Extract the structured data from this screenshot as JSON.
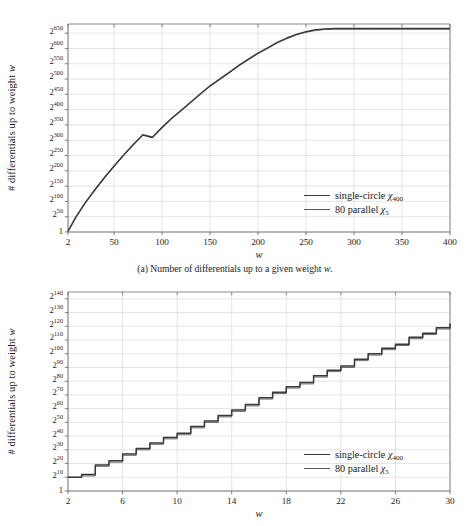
{
  "figure": {
    "background": "#ffffff",
    "axis_color": "#6e6e6e",
    "grid_color": "#d9d9d9",
    "series_colors": {
      "single_circle": "#3a3a3a",
      "parallel": "#5a5a5a"
    }
  },
  "panel_a": {
    "caption": "(a) Number of differentials up to a given weight w.",
    "caption_prefix": "(a) Number of differentials up to a given weight ",
    "caption_var": "w",
    "caption_suffix": ".",
    "ylabel_text": "# differentials up to weight ",
    "ylabel_var": "w",
    "xlabel": "w",
    "legend": [
      {
        "label": "single-circle ",
        "chi": "χ",
        "sub": "400",
        "color": "#3a3a3a",
        "width": 1.6
      },
      {
        "label": "80 parallel ",
        "chi": "χ",
        "sub": "5",
        "color": "#5a5a5a",
        "width": 0.9
      }
    ],
    "ytick_labels": [
      "1",
      "2²⁵⁰",
      "2¹⁰⁰",
      "2¹⁵⁰",
      "2²⁰⁰",
      "2²⁵⁰",
      "2³⁰⁰",
      "2³⁵⁰",
      "2⁴⁰⁰",
      "2⁴⁵⁰",
      "2⁵⁰⁰",
      "2⁵⁵⁰",
      "2⁶⁰⁰",
      "2⁶⁵⁰"
    ],
    "ytick_bases": [
      "1",
      "2",
      "2",
      "2",
      "2",
      "2",
      "2",
      "2",
      "2",
      "2",
      "2",
      "2",
      "2",
      "2"
    ],
    "ytick_exps": [
      "",
      "50",
      "100",
      "150",
      "200",
      "250",
      "300",
      "350",
      "400",
      "450",
      "500",
      "550",
      "600",
      "650"
    ],
    "ytick_values": [
      0,
      50,
      100,
      150,
      200,
      250,
      300,
      350,
      400,
      450,
      500,
      550,
      600,
      650
    ],
    "xtick_labels": [
      "2",
      "50",
      "100",
      "150",
      "200",
      "250",
      "300",
      "350",
      "400"
    ],
    "xtick_values": [
      2,
      50,
      100,
      150,
      200,
      250,
      300,
      350,
      400
    ]
  },
  "panel_b": {
    "caption": "",
    "ylabel_text": "# differentials up to weight ",
    "ylabel_var": "w",
    "xlabel": "w",
    "legend": [
      {
        "label": "single-circle ",
        "chi": "χ",
        "sub": "400",
        "color": "#3a3a3a",
        "width": 1.6
      },
      {
        "label": "80 parallel ",
        "chi": "χ",
        "sub": "5",
        "color": "#5a5a5a",
        "width": 0.9
      }
    ],
    "ytick_bases": [
      "1",
      "2",
      "2",
      "2",
      "2",
      "2",
      "2",
      "2",
      "2",
      "2",
      "2",
      "2",
      "2",
      "2",
      "2"
    ],
    "ytick_exps": [
      "",
      "10",
      "20",
      "30",
      "40",
      "50",
      "60",
      "70",
      "80",
      "90",
      "100",
      "110",
      "120",
      "130",
      "140"
    ],
    "ytick_values": [
      0,
      10,
      20,
      30,
      40,
      50,
      60,
      70,
      80,
      90,
      100,
      110,
      120,
      130,
      140
    ],
    "xtick_labels": [
      "2",
      "6",
      "10",
      "14",
      "18",
      "22",
      "26",
      "30"
    ],
    "xtick_values": [
      2,
      6,
      10,
      14,
      18,
      22,
      26,
      30
    ]
  },
  "chart_data": [
    {
      "id": "panel-a",
      "type": "line",
      "title": "(a) Number of differentials up to a given weight w.",
      "xlabel": "w",
      "ylabel": "# differentials up to weight w",
      "xlim": [
        2,
        400
      ],
      "ylim": [
        0,
        680
      ],
      "y_axis_scale": "log2 exponent",
      "grid": true,
      "legend_position": "inside-right-lower",
      "xticks": [
        2,
        50,
        100,
        150,
        200,
        250,
        300,
        350,
        400
      ],
      "yticks": [
        0,
        50,
        100,
        150,
        200,
        250,
        300,
        350,
        400,
        450,
        500,
        550,
        600,
        650
      ],
      "ytick_labels": [
        "1",
        "2^50",
        "2^100",
        "2^150",
        "2^200",
        "2^250",
        "2^300",
        "2^350",
        "2^400",
        "2^450",
        "2^500",
        "2^550",
        "2^600",
        "2^650"
      ],
      "series": [
        {
          "name": "single-circle χ400",
          "color": "#3a3a3a",
          "x": [
            2,
            10,
            20,
            30,
            40,
            50,
            60,
            70,
            80,
            90,
            100,
            110,
            120,
            130,
            140,
            150,
            160,
            170,
            180,
            190,
            200,
            210,
            220,
            230,
            240,
            250,
            260,
            270,
            280,
            285,
            290,
            300,
            320,
            340,
            360,
            380,
            400
          ],
          "y": [
            2,
            48,
            96,
            138,
            178,
            216,
            252,
            286,
            318,
            310,
            342,
            372,
            398,
            425,
            452,
            478,
            500,
            522,
            545,
            565,
            585,
            602,
            620,
            634,
            646,
            655,
            661,
            664,
            665,
            665,
            665,
            665,
            665,
            665,
            665,
            665,
            665
          ],
          "y_units": "log2(count)"
        },
        {
          "name": "80 parallel χ5",
          "color": "#5a5a5a",
          "x": [
            2,
            10,
            20,
            30,
            40,
            50,
            60,
            70,
            80,
            90,
            100,
            110,
            120,
            130,
            140,
            150,
            160,
            170,
            180,
            190,
            200,
            210,
            220,
            230,
            240,
            250,
            260,
            270,
            280,
            285,
            290,
            300,
            320,
            340,
            360,
            380,
            400
          ],
          "y": [
            2,
            46,
            94,
            136,
            176,
            214,
            250,
            284,
            316,
            308,
            340,
            370,
            396,
            423,
            450,
            476,
            498,
            520,
            543,
            563,
            583,
            600,
            618,
            632,
            644,
            653,
            659,
            662,
            663,
            663,
            663,
            663,
            663,
            663,
            663,
            663,
            663
          ],
          "y_units": "log2(count)"
        }
      ],
      "note": "Both series nearly coincide; curve rises concavely from ~2^2 at w=2 and saturates near 2^665 at w≈285."
    },
    {
      "id": "panel-b",
      "type": "line",
      "line_style": "step",
      "title": "",
      "xlabel": "w",
      "ylabel": "# differentials up to weight w",
      "xlim": [
        2,
        30
      ],
      "ylim": [
        0,
        145
      ],
      "y_axis_scale": "log2 exponent",
      "grid": true,
      "legend_position": "inside-right-lower",
      "xticks": [
        2,
        6,
        10,
        14,
        18,
        22,
        26,
        30
      ],
      "yticks": [
        0,
        10,
        20,
        30,
        40,
        50,
        60,
        70,
        80,
        90,
        100,
        110,
        120,
        130,
        140
      ],
      "ytick_labels": [
        "1",
        "2^10",
        "2^20",
        "2^30",
        "2^40",
        "2^50",
        "2^60",
        "2^70",
        "2^80",
        "2^90",
        "2^100",
        "2^110",
        "2^120",
        "2^130",
        "2^140"
      ],
      "series": [
        {
          "name": "single-circle χ400",
          "color": "#3a3a3a",
          "x": [
            2,
            3,
            4,
            5,
            6,
            7,
            8,
            9,
            10,
            11,
            12,
            13,
            14,
            15,
            16,
            17,
            18,
            19,
            20,
            21,
            22,
            23,
            24,
            25,
            26,
            27,
            28,
            29,
            30
          ],
          "y": [
            10,
            12,
            19,
            22,
            27,
            31,
            35,
            39,
            42,
            47,
            51,
            55,
            59,
            63,
            68,
            72,
            76,
            79,
            84,
            88,
            91,
            96,
            100,
            104,
            107,
            112,
            115,
            119,
            122
          ],
          "y_units": "log2(count)"
        },
        {
          "name": "80 parallel χ5",
          "color": "#5a5a5a",
          "x": [
            2,
            3,
            4,
            5,
            6,
            7,
            8,
            9,
            10,
            11,
            12,
            13,
            14,
            15,
            16,
            17,
            18,
            19,
            20,
            21,
            22,
            23,
            24,
            25,
            26,
            27,
            28,
            29,
            30
          ],
          "y": [
            10,
            11,
            18,
            21,
            26,
            30,
            34,
            38,
            41,
            46,
            50,
            54,
            58,
            62,
            67,
            71,
            75,
            78,
            83,
            87,
            90,
            95,
            99,
            103,
            106,
            111,
            114,
            118,
            121
          ],
          "y_units": "log2(count)"
        }
      ],
      "note": "Staircase: value constant over each integer weight interval, jumping at integers; both series nearly coincide."
    }
  ]
}
